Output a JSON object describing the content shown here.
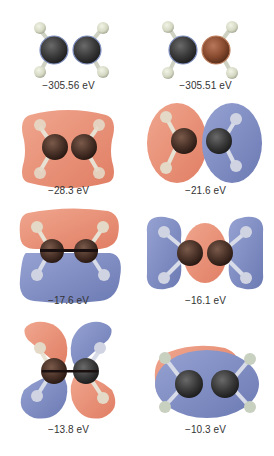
{
  "figure": {
    "colors": {
      "positive_lobe": "#e8917a",
      "negative_lobe": "#7e8cc0",
      "carbon": "#3a3a3a",
      "carbon_alt": "#7a4a32",
      "hydrogen": "#d8dcc8",
      "label_text": "#333333"
    },
    "orbitals": [
      {
        "id": "core-1",
        "energy": "−305.56 eV"
      },
      {
        "id": "core-2",
        "energy": "−305.51 eV"
      },
      {
        "id": "mo-1",
        "energy": "−28.3 eV"
      },
      {
        "id": "mo-2",
        "energy": "−21.6 eV"
      },
      {
        "id": "mo-3",
        "energy": "−17.6 eV"
      },
      {
        "id": "mo-4",
        "energy": "−16.1 eV"
      },
      {
        "id": "mo-5",
        "energy": "−13.8 eV"
      },
      {
        "id": "mo-6",
        "energy": "−10.3 eV"
      }
    ]
  }
}
